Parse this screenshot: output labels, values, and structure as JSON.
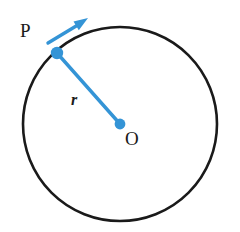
{
  "figure": {
    "type": "geometry-diagram",
    "background_color": "#ffffff",
    "circle": {
      "stroke_color": "#1a1a1a",
      "stroke_width": 2.6,
      "fill": "none",
      "center_x": 120,
      "center_y": 124,
      "radius": 97
    },
    "radius_line": {
      "color": "#3494D6",
      "stroke_width": 3.4,
      "from_x": 57,
      "from_y": 53,
      "to_x": 120,
      "to_y": 124
    },
    "point_p": {
      "label": "P",
      "color": "#3494D6",
      "x": 57,
      "y": 53,
      "dot_radius": 6.2,
      "label_x": 20,
      "label_y": 21
    },
    "point_o": {
      "label": "O",
      "color": "#3494D6",
      "x": 120,
      "y": 124,
      "dot_radius": 5.4,
      "label_x": 125,
      "label_y": 129
    },
    "radius_label": {
      "label": "r",
      "x": 71,
      "y": 92,
      "style": "italic"
    },
    "tangent_arrow": {
      "color": "#3494D6",
      "stroke_width": 3.4,
      "from_x": 48,
      "from_y": 43,
      "to_x": 86,
      "to_y": 20,
      "head_length": 13,
      "head_width": 11
    },
    "colors": {
      "accent_blue": "#3494D6",
      "outline_black": "#1a1a1a",
      "background": "#ffffff"
    }
  }
}
